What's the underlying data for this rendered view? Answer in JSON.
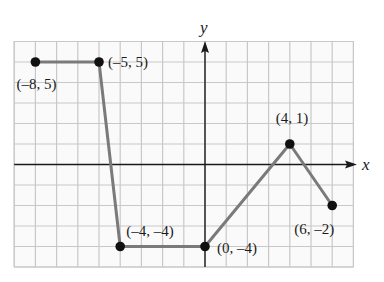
{
  "chart_data": {
    "type": "line",
    "title": "",
    "xlabel": "x",
    "ylabel": "y",
    "xlim": [
      -9,
      7
    ],
    "ylim": [
      -5,
      6
    ],
    "grid": true,
    "grid_step": 1,
    "legend": null,
    "series": [
      {
        "name": "piecewise",
        "points": [
          {
            "x": -8,
            "y": 5,
            "label": "(–8, 5)"
          },
          {
            "x": -5,
            "y": 5,
            "label": "(–5, 5)"
          },
          {
            "x": -4,
            "y": -4,
            "label": "(–4, –4)"
          },
          {
            "x": 0,
            "y": -4,
            "label": "(0, –4)"
          },
          {
            "x": 4,
            "y": 1,
            "label": "(4, 1)"
          },
          {
            "x": 6,
            "y": -2,
            "label": "(6, –2)"
          }
        ]
      }
    ]
  },
  "colors": {
    "grid": "#c8c8c8",
    "axis": "#1a1a1a",
    "line": "#7a7a7a",
    "point": "#111111"
  }
}
